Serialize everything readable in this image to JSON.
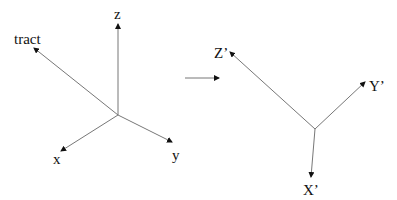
{
  "diagram": {
    "left_frame": {
      "labels": {
        "z": "z",
        "tract": "tract",
        "x": "x",
        "y": "y"
      }
    },
    "transform_arrow": {
      "label": ""
    },
    "right_frame": {
      "labels": {
        "z_prime": "Z’",
        "y_prime": "Y’",
        "x_prime": "X’"
      }
    },
    "colors": {
      "line": "#777777",
      "text": "#111111",
      "background": "#ffffff"
    }
  }
}
